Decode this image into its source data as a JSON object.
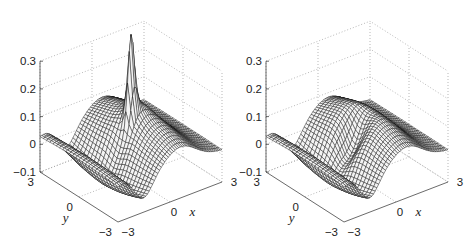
{
  "figure": {
    "panels": [
      {
        "id": "left",
        "description": "3D wireframe mesh surface with a sharp narrow spike near the center",
        "z_ticks": [
          "0.3",
          "0.2",
          "0.1",
          "0",
          "−0.1"
        ],
        "y_ticks": [
          "3",
          "0",
          "−3"
        ],
        "x_ticks": [
          "−3",
          "0",
          "3"
        ],
        "xlabel": "x",
        "ylabel": "y"
      },
      {
        "id": "right",
        "description": "3D wireframe mesh surface, smooth version without the spike",
        "z_ticks": [
          "0.3",
          "0.2",
          "0.1",
          "0",
          "−0.1"
        ],
        "y_ticks": [
          "3",
          "0",
          "−3"
        ],
        "x_ticks": [
          "−3",
          "0",
          "3"
        ],
        "xlabel": "x",
        "ylabel": "y"
      }
    ]
  },
  "chart_data": [
    {
      "type": "surface",
      "title": "",
      "xlabel": "x",
      "ylabel": "y",
      "zlabel": "",
      "xlim": [
        -3,
        3
      ],
      "ylim": [
        -3,
        3
      ],
      "zlim": [
        -0.1,
        0.3
      ],
      "x_ticks": [
        -3,
        0,
        3
      ],
      "y_ticks": [
        -3,
        0,
        3
      ],
      "z_ticks": [
        -0.1,
        0,
        0.1,
        0.2,
        0.3
      ],
      "grid": true,
      "style": "black wireframe mesh",
      "features": {
        "spike": {
          "x": 0,
          "y": 0,
          "peak_z": 0.3
        },
        "ridge_height_approx": 0.1,
        "trough_depth_approx": -0.1,
        "edge_z_at_y_3": 0.02
      }
    },
    {
      "type": "surface",
      "title": "",
      "xlabel": "x",
      "ylabel": "y",
      "zlabel": "",
      "xlim": [
        -3,
        3
      ],
      "ylim": [
        -3,
        3
      ],
      "zlim": [
        -0.1,
        0.3
      ],
      "x_ticks": [
        -3,
        0,
        3
      ],
      "y_ticks": [
        -3,
        0,
        3
      ],
      "z_ticks": [
        -0.1,
        0,
        0.1,
        0.2,
        0.3
      ],
      "grid": true,
      "style": "black wireframe mesh",
      "features": {
        "dip_near_center": {
          "x": 0,
          "y": 0,
          "z_approx": 0.0
        },
        "ridge_height_approx": 0.1,
        "trough_depth_approx": -0.1,
        "edge_z_at_y_3": 0.0
      }
    }
  ]
}
